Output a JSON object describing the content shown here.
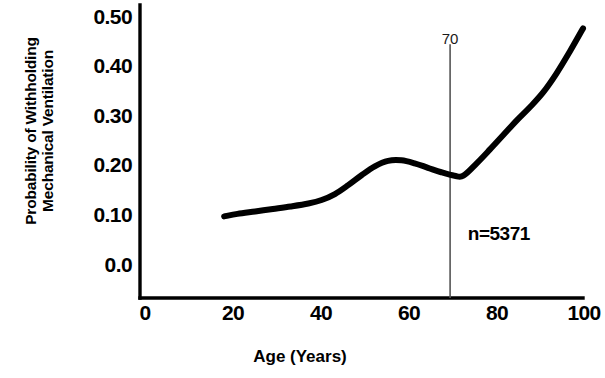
{
  "figure": {
    "background_color": "#ffffff",
    "ink_color": "#000000",
    "reference_line_color": "#555555"
  },
  "chart_data": {
    "type": "line",
    "title": "",
    "subtitle": "",
    "xlabel": "Age  (Years)",
    "ylabel": "Probability of Withholding Mechanical Ventilation",
    "ylabel_lines": [
      "Probability of Withholding",
      "Mechanical Ventilation"
    ],
    "xlim": [
      0,
      100
    ],
    "ylim": [
      0.0,
      0.5
    ],
    "xticks": [
      0,
      20,
      40,
      60,
      80,
      100
    ],
    "xticklabels": [
      "0",
      "20",
      "40",
      "60",
      "80",
      "100"
    ],
    "yticks": [
      0.0,
      0.1,
      0.2,
      0.3,
      0.4,
      0.5
    ],
    "yticklabels": [
      "0.0",
      "0.10",
      "0.20",
      "0.30",
      "0.40",
      "0.50"
    ],
    "grid": false,
    "tick_marks": false,
    "legend": null,
    "series": [
      {
        "name": "Probability of withholding mechanical ventilation",
        "line_width_px": 6,
        "color": "#000000",
        "x": [
          19,
          22,
          26,
          30,
          34,
          38,
          41,
          44,
          47,
          50,
          53,
          56,
          59,
          62,
          65,
          68,
          71,
          73,
          76,
          79,
          82,
          85,
          88,
          91,
          94,
          97,
          100
        ],
        "values": [
          0.098,
          0.103,
          0.108,
          0.113,
          0.118,
          0.124,
          0.131,
          0.143,
          0.161,
          0.181,
          0.199,
          0.21,
          0.211,
          0.205,
          0.196,
          0.187,
          0.18,
          0.18,
          0.205,
          0.233,
          0.262,
          0.291,
          0.318,
          0.348,
          0.386,
          0.43,
          0.477
        ]
      }
    ],
    "annotations": [
      {
        "name": "age-70-reference-line",
        "kind": "vline",
        "x": 70,
        "label": "70",
        "y_top": 0.445,
        "y_bottom": 0.0
      },
      {
        "name": "sample-size",
        "kind": "text",
        "text": "n=5371",
        "x": 74,
        "y": 0.05
      }
    ]
  }
}
